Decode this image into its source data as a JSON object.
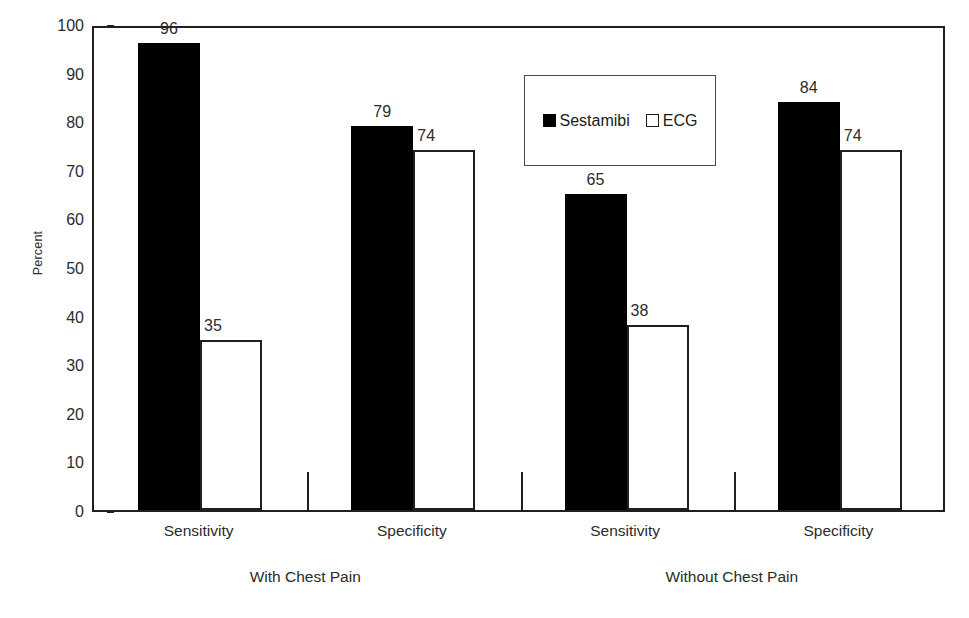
{
  "chart_data": {
    "type": "bar",
    "title": "",
    "subtitle": "",
    "xlabel": "",
    "ylabel": "Percent",
    "ylim": [
      0,
      100
    ],
    "yticks": [
      0,
      10,
      20,
      30,
      40,
      50,
      60,
      70,
      80,
      90,
      100
    ],
    "grid": false,
    "legend_position": "inside-top-center",
    "categories": [
      "Sensitivity",
      "Specificity",
      "Sensitivity",
      "Specificity"
    ],
    "groups": [
      {
        "label": "With Chest Pain",
        "categories": [
          "Sensitivity",
          "Specificity"
        ]
      },
      {
        "label": "Without Chest Pain",
        "categories": [
          "Sensitivity",
          "Specificity"
        ]
      }
    ],
    "series": [
      {
        "name": "Sestamibi",
        "color": "#000000",
        "style": "filled",
        "values": [
          96,
          79,
          65,
          84
        ]
      },
      {
        "name": "ECG",
        "color": "#ffffff",
        "style": "hollow",
        "values": [
          35,
          74,
          38,
          74
        ]
      }
    ],
    "bars": [
      {
        "group": "With Chest Pain",
        "category": "Sensitivity",
        "series": "Sestamibi",
        "value": 96,
        "label": "96",
        "style": "filled"
      },
      {
        "group": "With Chest Pain",
        "category": "Sensitivity",
        "series": "ECG",
        "value": 35,
        "label": "35",
        "style": "hollow"
      },
      {
        "group": "With Chest Pain",
        "category": "Specificity",
        "series": "Sestamibi",
        "value": 79,
        "label": "79",
        "style": "filled"
      },
      {
        "group": "With Chest Pain",
        "category": "Specificity",
        "series": "ECG",
        "value": 74,
        "label": "74",
        "style": "hollow"
      },
      {
        "group": "Without Chest Pain",
        "category": "Sensitivity",
        "series": "Sestamibi",
        "value": 65,
        "label": "65",
        "style": "filled"
      },
      {
        "group": "Without Chest Pain",
        "category": "Sensitivity",
        "series": "ECG",
        "value": 38,
        "label": "38",
        "style": "hollow"
      },
      {
        "group": "Without Chest Pain",
        "category": "Specificity",
        "series": "Sestamibi",
        "value": 84,
        "label": "84",
        "style": "filled"
      },
      {
        "group": "Without Chest Pain",
        "category": "Specificity",
        "series": "ECG",
        "value": 74,
        "label": "74",
        "style": "hollow"
      }
    ]
  },
  "legend": {
    "entries": [
      {
        "label": "Sestamibi",
        "style": "filled"
      },
      {
        "label": "ECG",
        "style": "hollow"
      }
    ]
  },
  "colors": {
    "axis": "#1f1f1f",
    "text": "#2b2b2b",
    "sestamibi": "#000000",
    "ecg": "#ffffff",
    "background": "#ffffff"
  }
}
